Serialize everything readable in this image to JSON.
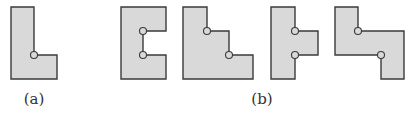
{
  "figure": {
    "colors": {
      "fill": "#d9d9d9",
      "stroke": "#3a3a3a",
      "label": "#333333"
    },
    "panels": [
      {
        "id": "a",
        "label": "(a)",
        "label_x": 34,
        "pieces": [
          {
            "name": "L-shape",
            "points": "11,7 34,7 34,55 57,55 57,79 11,79",
            "hinges": [
              [
                34,
                55
              ]
            ]
          }
        ]
      },
      {
        "id": "b",
        "label": "(b)",
        "label_x": 262,
        "pieces": [
          {
            "name": "C-shape",
            "points": "121,7 166,7 166,31 143,31 143,55 166,55 166,79 121,79",
            "hinges": [
              [
                143,
                31
              ],
              [
                143,
                55
              ]
            ]
          },
          {
            "name": "stair-shape",
            "points": "183,7 207,7 207,31 229,31 229,55 253,55 253,79 183,79",
            "hinges": [
              [
                207,
                31
              ],
              [
                229,
                55
              ]
            ]
          },
          {
            "name": "T-shape",
            "points": "271,7 295,7 295,31 318,31 318,55 295,55 295,79 271,79",
            "hinges": [
              [
                295,
                31
              ],
              [
                295,
                55
              ]
            ]
          },
          {
            "name": "Z-shape",
            "points": "335,7 358,7 358,31 404,31 404,79 381,79 381,55 335,55",
            "hinges": [
              [
                358,
                31
              ],
              [
                381,
                55
              ]
            ]
          }
        ]
      }
    ]
  }
}
